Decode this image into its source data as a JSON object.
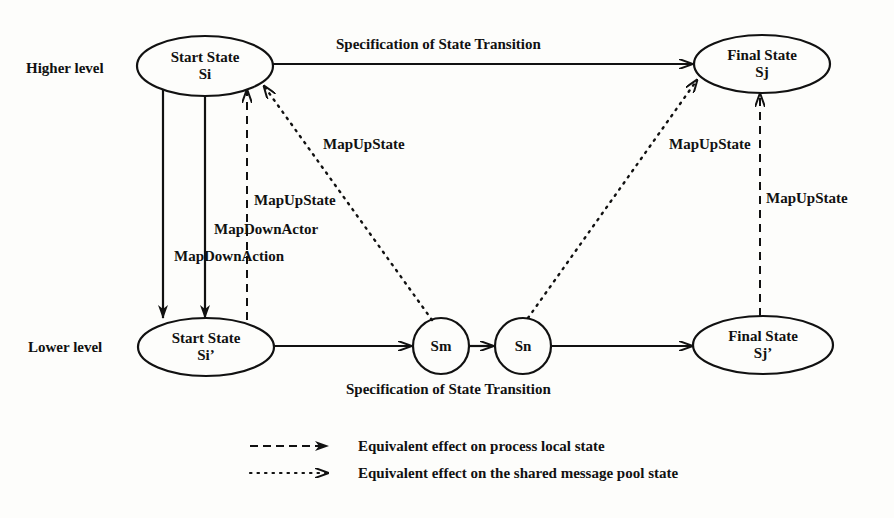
{
  "diagram": {
    "levels": {
      "higher": "Higher level",
      "lower": "Lower level"
    },
    "nodes": {
      "start_high": {
        "title": "Start State",
        "sub": "Si"
      },
      "final_high": {
        "title": "Final State",
        "sub": "Sj"
      },
      "start_low": {
        "title": "Start State",
        "sub": "Si’"
      },
      "final_low": {
        "title": "Final State",
        "sub": "Sj’"
      },
      "sm": {
        "title": "Sm"
      },
      "sn": {
        "title": "Sn"
      }
    },
    "edges": {
      "top_transition": "Specification of State Transition",
      "bottom_transition": "Specification of State Transition",
      "mapup_dotted_left": "MapUpState",
      "mapup_dashed_left": "MapUpState",
      "map_down_actor": "MapDownActor",
      "map_down_action": "MapDownAction",
      "mapup_dotted_right": "MapUpState",
      "mapup_dashed_right": "MapUpState"
    },
    "legend": [
      {
        "style": "dashed",
        "label": "Equivalent effect on process local state"
      },
      {
        "style": "dotted",
        "label": "Equivalent effect on the shared message pool state"
      }
    ],
    "colors": {
      "ink": "#111111",
      "background": "#fdfdfb"
    }
  }
}
